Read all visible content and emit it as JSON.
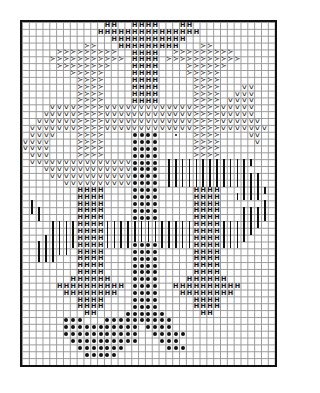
{
  "chart": {
    "type": "stitch-pattern-grid",
    "columns": 37,
    "rows": 50,
    "legend_symbols": {
      "H": "H",
      "V": "v",
      "gt": "≻",
      "dot": "",
      "sdot": "",
      "bar": ""
    },
    "runs": [
      {
        "row": 0,
        "sym": "H",
        "cols": [
          [
            12,
            13
          ],
          [
            16,
            19
          ],
          [
            23,
            24
          ]
        ]
      },
      {
        "row": 1,
        "sym": "H",
        "cols": [
          [
            11,
            25
          ]
        ]
      },
      {
        "row": 2,
        "sym": "H",
        "cols": [
          [
            13,
            23
          ]
        ]
      },
      {
        "row": 3,
        "sym": "gt",
        "cols": [
          [
            9,
            10
          ]
        ]
      },
      {
        "row": 3,
        "sym": "H",
        "cols": [
          [
            14,
            22
          ]
        ]
      },
      {
        "row": 3,
        "sym": "gt",
        "cols": [
          [
            26,
            27
          ]
        ]
      },
      {
        "row": 4,
        "sym": "gt",
        "cols": [
          [
            5,
            13
          ],
          [
            22,
            30
          ]
        ]
      },
      {
        "row": 4,
        "sym": "H",
        "cols": [
          [
            16,
            19
          ]
        ]
      },
      {
        "row": 5,
        "sym": "gt",
        "cols": [
          [
            4,
            14
          ],
          [
            21,
            31
          ]
        ]
      },
      {
        "row": 5,
        "sym": "H",
        "cols": [
          [
            16,
            19
          ]
        ]
      },
      {
        "row": 6,
        "sym": "gt",
        "cols": [
          [
            5,
            12
          ],
          [
            24,
            29
          ]
        ]
      },
      {
        "row": 6,
        "sym": "H",
        "cols": [
          [
            16,
            19
          ]
        ]
      },
      {
        "row": 7,
        "sym": "gt",
        "cols": [
          [
            7,
            11
          ],
          [
            24,
            28
          ]
        ]
      },
      {
        "row": 7,
        "sym": "H",
        "cols": [
          [
            16,
            19
          ]
        ]
      },
      {
        "row": 8,
        "sym": "gt",
        "cols": [
          [
            8,
            11
          ],
          [
            25,
            28
          ]
        ]
      },
      {
        "row": 8,
        "sym": "H",
        "cols": [
          [
            16,
            19
          ]
        ]
      },
      {
        "row": 9,
        "sym": "gt",
        "cols": [
          [
            8,
            11
          ],
          [
            25,
            28
          ]
        ]
      },
      {
        "row": 9,
        "sym": "H",
        "cols": [
          [
            16,
            19
          ]
        ]
      },
      {
        "row": 9,
        "sym": "V",
        "cols": [
          [
            32,
            33
          ]
        ]
      },
      {
        "row": 10,
        "sym": "gt",
        "cols": [
          [
            8,
            11
          ],
          [
            25,
            28
          ]
        ]
      },
      {
        "row": 10,
        "sym": "H",
        "cols": [
          [
            16,
            19
          ]
        ]
      },
      {
        "row": 10,
        "sym": "V",
        "cols": [
          [
            31,
            33
          ]
        ]
      },
      {
        "row": 11,
        "sym": "gt",
        "cols": [
          [
            8,
            11
          ],
          [
            25,
            28
          ]
        ]
      },
      {
        "row": 11,
        "sym": "H",
        "cols": [
          [
            16,
            19
          ]
        ]
      },
      {
        "row": 11,
        "sym": "V",
        "cols": [
          [
            30,
            33
          ]
        ]
      },
      {
        "row": 12,
        "sym": "V",
        "cols": [
          [
            4,
            7
          ],
          [
            12,
            24
          ],
          [
            29,
            33
          ]
        ]
      },
      {
        "row": 12,
        "sym": "gt",
        "cols": [
          [
            8,
            11
          ],
          [
            25,
            28
          ]
        ]
      },
      {
        "row": 13,
        "sym": "V",
        "cols": [
          [
            3,
            7
          ],
          [
            12,
            24
          ],
          [
            29,
            33
          ]
        ]
      },
      {
        "row": 13,
        "sym": "gt",
        "cols": [
          [
            8,
            11
          ],
          [
            25,
            28
          ]
        ]
      },
      {
        "row": 14,
        "sym": "V",
        "cols": [
          [
            2,
            7
          ],
          [
            12,
            24
          ],
          [
            29,
            34
          ]
        ]
      },
      {
        "row": 14,
        "sym": "gt",
        "cols": [
          [
            8,
            11
          ],
          [
            25,
            28
          ]
        ]
      },
      {
        "row": 15,
        "sym": "V",
        "cols": [
          [
            1,
            7
          ],
          [
            12,
            24
          ],
          [
            29,
            35
          ]
        ]
      },
      {
        "row": 15,
        "sym": "gt",
        "cols": [
          [
            8,
            11
          ],
          [
            25,
            28
          ]
        ]
      },
      {
        "row": 16,
        "sym": "V",
        "cols": [
          [
            1,
            4
          ],
          [
            33,
            34
          ]
        ]
      },
      {
        "row": 16,
        "sym": "gt",
        "cols": [
          [
            8,
            11
          ],
          [
            25,
            28
          ]
        ]
      },
      {
        "row": 16,
        "sym": "dot",
        "cols": [
          [
            16,
            19
          ]
        ]
      },
      {
        "row": 16,
        "sym": "sdot",
        "cols": [
          [
            22,
            22
          ]
        ]
      },
      {
        "row": 17,
        "sym": "V",
        "cols": [
          [
            0,
            3
          ],
          [
            34,
            34
          ]
        ]
      },
      {
        "row": 17,
        "sym": "gt",
        "cols": [
          [
            8,
            11
          ],
          [
            25,
            28
          ]
        ]
      },
      {
        "row": 17,
        "sym": "dot",
        "cols": [
          [
            16,
            19
          ]
        ]
      },
      {
        "row": 18,
        "sym": "V",
        "cols": [
          [
            0,
            3
          ]
        ]
      },
      {
        "row": 18,
        "sym": "gt",
        "cols": [
          [
            8,
            11
          ],
          [
            25,
            28
          ]
        ]
      },
      {
        "row": 18,
        "sym": "dot",
        "cols": [
          [
            16,
            19
          ]
        ]
      },
      {
        "row": 19,
        "sym": "V",
        "cols": [
          [
            1,
            3
          ]
        ]
      },
      {
        "row": 19,
        "sym": "gt",
        "cols": [
          [
            8,
            11
          ],
          [
            25,
            28
          ]
        ]
      },
      {
        "row": 19,
        "sym": "dot",
        "cols": [
          [
            16,
            19
          ]
        ]
      },
      {
        "row": 20,
        "sym": "V",
        "cols": [
          [
            1,
            15
          ]
        ]
      },
      {
        "row": 20,
        "sym": "dot",
        "cols": [
          [
            16,
            19
          ]
        ]
      },
      {
        "row": 20,
        "sym": "bar",
        "cols": [
          [
            21,
            33
          ]
        ]
      },
      {
        "row": 21,
        "sym": "V",
        "cols": [
          [
            3,
            15
          ]
        ]
      },
      {
        "row": 21,
        "sym": "dot",
        "cols": [
          [
            16,
            19
          ]
        ]
      },
      {
        "row": 21,
        "sym": "bar",
        "cols": [
          [
            21,
            32
          ]
        ]
      },
      {
        "row": 22,
        "sym": "V",
        "cols": [
          [
            4,
            15
          ]
        ]
      },
      {
        "row": 22,
        "sym": "dot",
        "cols": [
          [
            16,
            19
          ]
        ]
      },
      {
        "row": 22,
        "sym": "bar",
        "cols": [
          [
            21,
            34
          ]
        ]
      },
      {
        "row": 23,
        "sym": "V",
        "cols": [
          [
            6,
            15
          ]
        ]
      },
      {
        "row": 23,
        "sym": "dot",
        "cols": [
          [
            16,
            19
          ]
        ]
      },
      {
        "row": 23,
        "sym": "bar",
        "cols": [
          [
            21,
            34
          ]
        ]
      },
      {
        "row": 24,
        "sym": "H",
        "cols": [
          [
            8,
            11
          ],
          [
            25,
            28
          ]
        ]
      },
      {
        "row": 24,
        "sym": "dot",
        "cols": [
          [
            16,
            19
          ]
        ]
      },
      {
        "row": 24,
        "sym": "bar",
        "cols": [
          [
            32,
            35
          ]
        ]
      },
      {
        "row": 25,
        "sym": "H",
        "cols": [
          [
            8,
            11
          ],
          [
            25,
            28
          ]
        ]
      },
      {
        "row": 25,
        "sym": "dot",
        "cols": [
          [
            16,
            19
          ]
        ]
      },
      {
        "row": 25,
        "sym": "bar",
        "cols": [
          [
            31,
            34
          ]
        ]
      },
      {
        "row": 26,
        "sym": "bar",
        "cols": [
          [
            1,
            1
          ],
          [
            35,
            35
          ]
        ]
      },
      {
        "row": 26,
        "sym": "H",
        "cols": [
          [
            8,
            11
          ],
          [
            25,
            28
          ]
        ]
      },
      {
        "row": 26,
        "sym": "dot",
        "cols": [
          [
            16,
            19
          ]
        ]
      },
      {
        "row": 27,
        "sym": "bar",
        "cols": [
          [
            1,
            2
          ],
          [
            32,
            35
          ]
        ]
      },
      {
        "row": 27,
        "sym": "H",
        "cols": [
          [
            8,
            11
          ],
          [
            25,
            28
          ]
        ]
      },
      {
        "row": 27,
        "sym": "dot",
        "cols": [
          [
            16,
            19
          ]
        ]
      },
      {
        "row": 28,
        "sym": "bar",
        "cols": [
          [
            2,
            2
          ],
          [
            32,
            35
          ]
        ]
      },
      {
        "row": 28,
        "sym": "H",
        "cols": [
          [
            8,
            11
          ],
          [
            25,
            28
          ]
        ]
      },
      {
        "row": 28,
        "sym": "dot",
        "cols": [
          [
            16,
            19
          ]
        ]
      },
      {
        "row": 29,
        "sym": "bar",
        "cols": [
          [
            4,
            7
          ],
          [
            12,
            24
          ],
          [
            29,
            34
          ]
        ]
      },
      {
        "row": 29,
        "sym": "H",
        "cols": [
          [
            8,
            11
          ],
          [
            25,
            28
          ]
        ]
      },
      {
        "row": 30,
        "sym": "bar",
        "cols": [
          [
            4,
            7
          ],
          [
            12,
            24
          ],
          [
            29,
            33
          ]
        ]
      },
      {
        "row": 30,
        "sym": "H",
        "cols": [
          [
            8,
            11
          ],
          [
            25,
            28
          ]
        ]
      },
      {
        "row": 31,
        "sym": "bar",
        "cols": [
          [
            3,
            7
          ],
          [
            12,
            24
          ],
          [
            29,
            32
          ]
        ]
      },
      {
        "row": 31,
        "sym": "H",
        "cols": [
          [
            8,
            11
          ],
          [
            25,
            28
          ]
        ]
      },
      {
        "row": 32,
        "sym": "bar",
        "cols": [
          [
            2,
            7
          ],
          [
            12,
            15
          ],
          [
            20,
            24
          ],
          [
            29,
            31
          ]
        ]
      },
      {
        "row": 32,
        "sym": "H",
        "cols": [
          [
            8,
            11
          ],
          [
            25,
            28
          ]
        ]
      },
      {
        "row": 32,
        "sym": "dot",
        "cols": [
          [
            16,
            19
          ]
        ]
      },
      {
        "row": 33,
        "sym": "bar",
        "cols": [
          [
            2,
            6
          ]
        ]
      },
      {
        "row": 33,
        "sym": "H",
        "cols": [
          [
            8,
            11
          ],
          [
            25,
            28
          ]
        ]
      },
      {
        "row": 33,
        "sym": "dot",
        "cols": [
          [
            16,
            19
          ]
        ]
      },
      {
        "row": 34,
        "sym": "bar",
        "cols": [
          [
            2,
            4
          ]
        ]
      },
      {
        "row": 34,
        "sym": "H",
        "cols": [
          [
            8,
            11
          ],
          [
            25,
            28
          ]
        ]
      },
      {
        "row": 34,
        "sym": "dot",
        "cols": [
          [
            16,
            19
          ]
        ]
      },
      {
        "row": 35,
        "sym": "H",
        "cols": [
          [
            8,
            11
          ],
          [
            25,
            28
          ]
        ]
      },
      {
        "row": 35,
        "sym": "dot",
        "cols": [
          [
            16,
            19
          ]
        ]
      },
      {
        "row": 36,
        "sym": "H",
        "cols": [
          [
            8,
            11
          ],
          [
            25,
            28
          ]
        ]
      },
      {
        "row": 36,
        "sym": "dot",
        "cols": [
          [
            16,
            19
          ]
        ]
      },
      {
        "row": 37,
        "sym": "H",
        "cols": [
          [
            7,
            12
          ],
          [
            24,
            29
          ]
        ]
      },
      {
        "row": 37,
        "sym": "dot",
        "cols": [
          [
            16,
            19
          ]
        ]
      },
      {
        "row": 38,
        "sym": "H",
        "cols": [
          [
            5,
            14
          ],
          [
            22,
            31
          ]
        ]
      },
      {
        "row": 38,
        "sym": "dot",
        "cols": [
          [
            16,
            19
          ]
        ]
      },
      {
        "row": 39,
        "sym": "H",
        "cols": [
          [
            6,
            13
          ],
          [
            23,
            30
          ]
        ]
      },
      {
        "row": 39,
        "sym": "dot",
        "cols": [
          [
            16,
            19
          ]
        ]
      },
      {
        "row": 40,
        "sym": "H",
        "cols": [
          [
            8,
            11
          ],
          [
            25,
            28
          ]
        ]
      },
      {
        "row": 40,
        "sym": "dot",
        "cols": [
          [
            16,
            19
          ]
        ]
      },
      {
        "row": 41,
        "sym": "H",
        "cols": [
          [
            8,
            11
          ],
          [
            25,
            28
          ]
        ]
      },
      {
        "row": 41,
        "sym": "dot",
        "cols": [
          [
            16,
            19
          ]
        ]
      },
      {
        "row": 42,
        "sym": "H",
        "cols": [
          [
            9,
            10
          ],
          [
            26,
            27
          ]
        ]
      },
      {
        "row": 42,
        "sym": "dot",
        "cols": [
          [
            15,
            20
          ]
        ]
      },
      {
        "row": 43,
        "sym": "dot",
        "cols": [
          [
            6,
            8
          ],
          [
            12,
            21
          ]
        ]
      },
      {
        "row": 44,
        "sym": "dot",
        "cols": [
          [
            6,
            16
          ],
          [
            18,
            21
          ]
        ]
      },
      {
        "row": 45,
        "sym": "dot",
        "cols": [
          [
            6,
            16
          ],
          [
            19,
            23
          ]
        ]
      },
      {
        "row": 46,
        "sym": "dot",
        "cols": [
          [
            7,
            16
          ],
          [
            20,
            22
          ]
        ]
      },
      {
        "row": 47,
        "sym": "dot",
        "cols": [
          [
            8,
            14
          ],
          [
            21,
            23
          ]
        ]
      },
      {
        "row": 48,
        "sym": "dot",
        "cols": [
          [
            9,
            13
          ]
        ]
      }
    ]
  }
}
